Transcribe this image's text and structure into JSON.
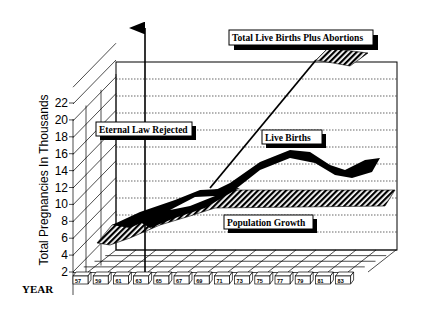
{
  "chart_data": {
    "type": "area",
    "title": "",
    "xlabel": "YEAR",
    "ylabel": "Total Pregnancies In Thousands",
    "ylim": [
      2,
      22
    ],
    "yticks": [
      2,
      4,
      6,
      8,
      10,
      12,
      14,
      16,
      18,
      20,
      22
    ],
    "categories": [
      "57",
      "59",
      "61",
      "63",
      "65",
      "67",
      "69",
      "71",
      "73",
      "75",
      "77",
      "79",
      "81",
      "83"
    ],
    "grid": true,
    "style": "3d ribbon",
    "series": [
      {
        "name": "Total Live Births Plus Abortions",
        "values": [
          6,
          7.5,
          8.5,
          8.5,
          9,
          9.5,
          10,
          12,
          15,
          17.5,
          19.5,
          21.5,
          23.5,
          24.5
        ]
      },
      {
        "name": "Live Births",
        "values": [
          6,
          7.5,
          8.5,
          8.5,
          9,
          9.5,
          10,
          11,
          12.5,
          13.5,
          13.5,
          12.5,
          12,
          13
        ]
      },
      {
        "name": "Population Growth",
        "values": [
          5.5,
          7,
          8,
          8.5,
          9.5,
          9.5,
          9.5,
          9.5,
          9.5,
          9.5,
          9.5,
          9.5,
          9.5,
          9.5
        ]
      }
    ],
    "annotations": [
      {
        "label": "Eternal Law Rejected",
        "x": "63",
        "type": "vertical-arrow"
      },
      {
        "label": "Total Live Births Plus Abortions"
      },
      {
        "label": "Live Births"
      },
      {
        "label": "Population Growth"
      }
    ]
  },
  "labels": {
    "ylabel": "Total Pregnancies In Thousands",
    "xlabel": "YEAR",
    "eternal": "Eternal Law Rejected",
    "total": "Total Live Births Plus Abortions",
    "live": "Live Births",
    "pop": "Population Growth"
  }
}
